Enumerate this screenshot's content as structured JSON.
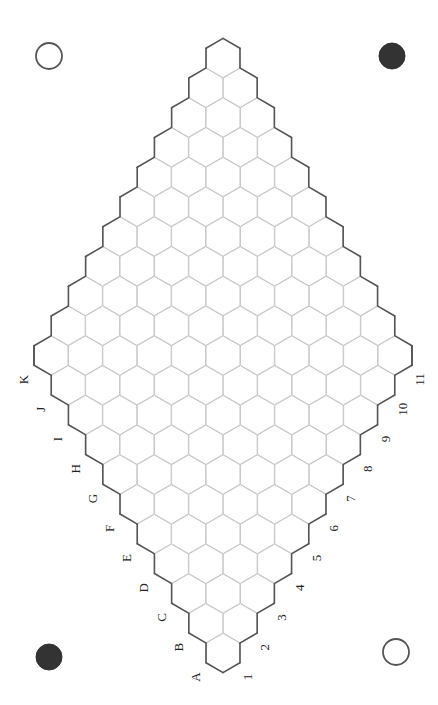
{
  "board": {
    "type": "hex",
    "size": 11,
    "letters": [
      "A",
      "B",
      "C",
      "D",
      "E",
      "F",
      "G",
      "H",
      "I",
      "J",
      "K"
    ],
    "numbers": [
      "1",
      "2",
      "3",
      "4",
      "5",
      "6",
      "7",
      "8",
      "9",
      "10",
      "11"
    ],
    "origin": [
      223,
      653
    ],
    "step_x": 17.2,
    "step_y": 29.75,
    "cell_radius": 19.6,
    "colors": {
      "cell_fill": "#ffffff",
      "grid_line": "#c8c8c8",
      "border_line": "#555555",
      "label": "#222222"
    }
  },
  "corner_markers": [
    {
      "name": "top-left-marker",
      "cx": 49,
      "cy": 56,
      "r": 13,
      "style": "hollow"
    },
    {
      "name": "top-right-marker",
      "cx": 392,
      "cy": 56,
      "r": 13,
      "style": "filled"
    },
    {
      "name": "bottom-left-marker",
      "cx": 49,
      "cy": 657,
      "r": 13,
      "style": "filled"
    },
    {
      "name": "bottom-right-marker",
      "cx": 396,
      "cy": 652,
      "r": 13,
      "style": "hollow"
    }
  ]
}
